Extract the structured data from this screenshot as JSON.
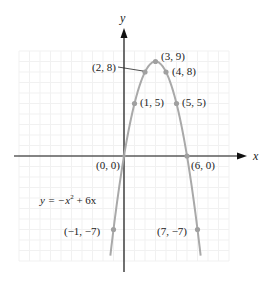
{
  "chart_data": {
    "type": "line",
    "title": "",
    "xlabel": "x",
    "ylabel": "y",
    "equation": "y = −x² + 6x",
    "equation_parts": {
      "lhs": "y = −x",
      "exp": "2",
      "rhs": " + 6x"
    },
    "xlim": [
      -10,
      10
    ],
    "ylim": [
      -10,
      10
    ],
    "grid": true,
    "legend": null,
    "series": [
      {
        "name": "y = -x^2 + 6x",
        "function": "-x^2 + 6x",
        "x_range": [
          -1.3,
          7.3
        ],
        "color": "#a9a9a9"
      }
    ],
    "points": [
      {
        "x": 3,
        "y": 9,
        "label": "(3, 9)"
      },
      {
        "x": 2,
        "y": 8,
        "label": "(2, 8)"
      },
      {
        "x": 4,
        "y": 8,
        "label": "(4, 8)"
      },
      {
        "x": 1,
        "y": 5,
        "label": "(1, 5)"
      },
      {
        "x": 5,
        "y": 5,
        "label": "(5, 5)"
      },
      {
        "x": 0,
        "y": 0,
        "label": "(0, 0)"
      },
      {
        "x": 6,
        "y": 0,
        "label": "(6, 0)"
      },
      {
        "x": -1,
        "y": -7,
        "label": "(−1, −7)"
      },
      {
        "x": 7,
        "y": -7,
        "label": "(7, −7)"
      }
    ]
  },
  "colors": {
    "curve": "#a9a9a9",
    "point": "#a0a0a0",
    "axis": "#111111",
    "grid": "#f1f1f1",
    "text": "#222222"
  }
}
